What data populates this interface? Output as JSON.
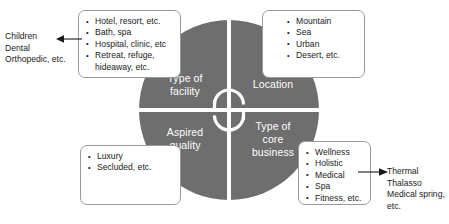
{
  "diagram": {
    "wheel": {
      "center_icon": "cycle-arrows-icon",
      "color": "#6e6e6e",
      "quadrants": [
        {
          "id": "type-of-facility",
          "label": "Type of\nfacility"
        },
        {
          "id": "location",
          "label": "Location"
        },
        {
          "id": "aspired-quality",
          "label": "Aspired\nquality"
        },
        {
          "id": "type-of-core-business",
          "label": "Type of\ncore\nbusiness"
        }
      ]
    },
    "boxes": {
      "facility": {
        "items": [
          "Hotel, resort, etc.",
          "Bath, spa",
          "Hospital, clinic, etc",
          "Retreat, refuge,",
          "hideaway, etc."
        ]
      },
      "location": {
        "items": [
          "Mountain",
          "Sea",
          "Urban",
          "Desert, etc."
        ]
      },
      "quality": {
        "items": [
          "Luxury",
          "Secluded, etc."
        ]
      },
      "core_business": {
        "items": [
          "Wellness",
          "Holistic",
          "Medical",
          "Spa",
          "Fitness, etc."
        ]
      }
    },
    "annotations": {
      "left": "Children\nDental\nOrthopedic, etc.",
      "right": "Thermal\nThalasso\nMedical spring,\netc."
    }
  }
}
